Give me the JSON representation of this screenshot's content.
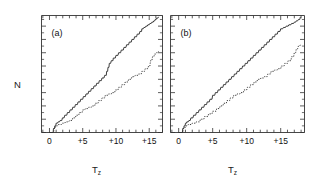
{
  "figure": {
    "background": "#ffffff",
    "line_color": "#333333",
    "text_color": "#111111"
  },
  "axis": {
    "y_label": "N",
    "x_label_main": "T",
    "x_label_sub": "z",
    "y_ticks": [
      0,
      10,
      20,
      30,
      40,
      50,
      60,
      70,
      80
    ],
    "y_tick_labels": [
      "0",
      "10",
      "20",
      "30",
      "40",
      "50",
      "60",
      "70",
      "80"
    ],
    "y_min": 0,
    "y_max": 88,
    "x_ticks": [
      0,
      5,
      10,
      15
    ],
    "x_tick_labels": [
      "0",
      "+5",
      "+10",
      "+15"
    ],
    "x_minor_step": 1,
    "x_min": -1.2,
    "x_max": 18.5
  },
  "panels": [
    {
      "tag": "(a)",
      "x_min": -1.2,
      "x_max": 17.0
    },
    {
      "tag": "(b)",
      "x_min": -1.2,
      "x_max": 18.5
    }
  ],
  "chart_data": {
    "type": "line",
    "title": "",
    "subtitle": "",
    "xlabel": "Tz",
    "ylabel": "N",
    "xlim": [
      -1.2,
      18.5
    ],
    "ylim": [
      0,
      88
    ],
    "grid": false,
    "legend": "none",
    "annotations": [
      "(a)",
      "(b)"
    ],
    "panels": [
      {
        "tag": "(a)",
        "series": [
          {
            "name": "solid-staircase-a",
            "style": "solid",
            "x": [
              0.0,
              0.55,
              0.6,
              0.75,
              0.8,
              0.95,
              1.0,
              1.2,
              1.3,
              1.5,
              1.6,
              1.85,
              1.95,
              2.2,
              2.3,
              2.6,
              2.7,
              3.0,
              3.1,
              3.4,
              3.5,
              3.8,
              3.9,
              4.2,
              4.3,
              4.6,
              4.7,
              5.0,
              5.1,
              5.4,
              5.5,
              5.8,
              5.9,
              6.2,
              6.3,
              6.6,
              6.7,
              7.0,
              7.1,
              7.4,
              7.5,
              7.8,
              7.9,
              8.2,
              8.3,
              8.55,
              8.6,
              8.75,
              8.8,
              8.95,
              9.0,
              9.2,
              9.3,
              9.55,
              9.6,
              9.9,
              10.0,
              10.3,
              10.4,
              10.7,
              10.8,
              11.1,
              11.2,
              11.5,
              11.6,
              11.9,
              12.0,
              12.3,
              12.4,
              12.7,
              12.8,
              13.1,
              13.2,
              13.5,
              13.6,
              13.85,
              13.9,
              14.1,
              14.2,
              14.4,
              14.5,
              14.7,
              14.8,
              15.0,
              15.1,
              15.3,
              15.4,
              15.6,
              15.7,
              15.85,
              15.9,
              16.05,
              16.1,
              16.3,
              16.4
            ],
            "y": [
              0,
              0,
              3,
              3,
              5,
              5,
              7,
              7,
              8,
              8,
              9,
              9,
              11,
              11,
              13,
              13,
              15,
              15,
              17,
              17,
              19,
              19,
              21,
              21,
              23,
              23,
              25,
              25,
              27,
              27,
              29,
              29,
              31,
              31,
              33,
              33,
              35,
              35,
              37,
              37,
              39,
              39,
              41,
              41,
              43,
              43,
              46,
              46,
              49,
              49,
              52,
              52,
              54,
              54,
              56,
              56,
              58,
              58,
              60,
              60,
              62,
              62,
              64,
              64,
              66,
              66,
              68,
              68,
              70,
              70,
              72,
              72,
              74,
              74,
              76,
              76,
              78,
              78,
              79,
              79,
              80,
              80,
              81,
              81,
              82,
              82,
              83,
              83,
              84,
              84,
              85,
              85,
              86,
              86,
              87
            ],
            "description": "Upper solid cumulative step function rising from 0 to ~87"
          },
          {
            "name": "dotted-staircase-a",
            "style": "dotted",
            "x": [
              0.0,
              0.6,
              0.7,
              0.85,
              0.95,
              1.2,
              1.3,
              1.8,
              1.9,
              2.3,
              2.4,
              2.9,
              3.0,
              3.4,
              3.5,
              3.9,
              4.0,
              4.4,
              4.5,
              4.9,
              5.0,
              5.3,
              5.4,
              5.8,
              5.9,
              6.3,
              6.4,
              6.8,
              6.9,
              7.3,
              7.4,
              7.8,
              7.9,
              8.3,
              8.4,
              8.8,
              8.9,
              9.3,
              9.4,
              9.8,
              9.9,
              10.3,
              10.4,
              10.8,
              10.9,
              11.3,
              11.4,
              11.8,
              11.9,
              12.3,
              12.4,
              12.8,
              12.9,
              13.3,
              13.4,
              13.8,
              13.9,
              14.3,
              14.4,
              14.8,
              14.9,
              15.1,
              15.2,
              15.4,
              15.5,
              15.7,
              15.8,
              16.0,
              16.1,
              16.3,
              16.4
            ],
            "y": [
              0,
              0,
              3,
              3,
              5,
              5,
              6,
              6,
              7,
              7,
              8,
              8,
              9,
              9,
              11,
              11,
              13,
              13,
              15,
              15,
              17,
              17,
              18,
              18,
              19,
              19,
              20,
              20,
              22,
              22,
              24,
              24,
              26,
              26,
              28,
              28,
              29,
              29,
              30,
              30,
              32,
              32,
              34,
              34,
              36,
              36,
              38,
              38,
              40,
              40,
              42,
              42,
              43,
              43,
              44,
              44,
              46,
              46,
              48,
              48,
              50,
              50,
              54,
              54,
              57,
              57,
              59,
              59,
              60,
              60,
              61
            ],
            "description": "Lower dotted cumulative step function rising from 0 to ~61"
          }
        ]
      },
      {
        "tag": "(b)",
        "series": [
          {
            "name": "solid-staircase-b",
            "style": "solid",
            "x": [
              0.0,
              0.55,
              0.6,
              0.75,
              0.8,
              0.95,
              1.0,
              1.15,
              1.2,
              1.4,
              1.5,
              1.7,
              1.8,
              2.1,
              2.2,
              2.5,
              2.6,
              2.9,
              3.0,
              3.3,
              3.4,
              3.7,
              3.8,
              4.1,
              4.2,
              4.5,
              4.6,
              4.9,
              5.0,
              5.3,
              5.4,
              5.7,
              5.8,
              6.1,
              6.2,
              6.5,
              6.6,
              6.9,
              7.0,
              7.3,
              7.4,
              7.7,
              7.8,
              8.1,
              8.2,
              8.5,
              8.6,
              8.9,
              9.0,
              9.3,
              9.4,
              9.7,
              9.8,
              10.1,
              10.2,
              10.5,
              10.6,
              10.9,
              11.0,
              11.3,
              11.4,
              11.7,
              11.8,
              12.1,
              12.2,
              12.5,
              12.6,
              12.9,
              13.0,
              13.3,
              13.4,
              13.7,
              13.8,
              14.1,
              14.2,
              14.5,
              14.6,
              14.9,
              15.0,
              15.3,
              15.4,
              15.7,
              15.8,
              16.1,
              16.2,
              16.5,
              16.6,
              16.9,
              17.0,
              17.2,
              17.3,
              17.5,
              17.6,
              17.8,
              17.9
            ],
            "y": [
              0,
              0,
              3,
              3,
              5,
              5,
              7,
              7,
              8,
              8,
              9,
              9,
              11,
              11,
              13,
              13,
              15,
              15,
              17,
              17,
              19,
              19,
              21,
              21,
              23,
              23,
              25,
              25,
              28,
              28,
              30,
              30,
              32,
              32,
              34,
              34,
              36,
              36,
              38,
              38,
              40,
              40,
              42,
              42,
              44,
              44,
              46,
              46,
              48,
              48,
              50,
              50,
              52,
              52,
              54,
              54,
              56,
              56,
              58,
              58,
              60,
              60,
              62,
              62,
              64,
              64,
              66,
              66,
              68,
              68,
              70,
              70,
              72,
              72,
              74,
              74,
              76,
              76,
              78,
              78,
              79,
              79,
              80,
              80,
              81,
              81,
              82,
              82,
              83,
              83,
              84,
              84,
              85,
              85,
              87
            ],
            "description": "Upper solid cumulative step function for panel b"
          },
          {
            "name": "dotted-staircase-b",
            "style": "dotted",
            "x": [
              0.0,
              0.6,
              0.7,
              0.9,
              1.0,
              1.3,
              1.4,
              1.9,
              2.0,
              2.5,
              2.6,
              3.1,
              3.2,
              3.7,
              3.8,
              4.3,
              4.4,
              4.9,
              5.0,
              5.5,
              5.6,
              6.0,
              6.1,
              6.5,
              6.6,
              7.0,
              7.1,
              7.5,
              7.6,
              8.0,
              8.1,
              8.5,
              8.6,
              9.0,
              9.1,
              9.5,
              9.6,
              10.0,
              10.1,
              10.5,
              10.6,
              11.0,
              11.1,
              11.5,
              11.6,
              12.0,
              12.1,
              12.5,
              12.6,
              13.0,
              13.1,
              13.5,
              13.6,
              14.0,
              14.1,
              14.5,
              14.6,
              15.0,
              15.1,
              15.5,
              15.6,
              16.0,
              16.1,
              16.5,
              16.6,
              16.9,
              17.0,
              17.2,
              17.3,
              17.5,
              17.6,
              17.8,
              17.9
            ],
            "y": [
              0,
              0,
              3,
              3,
              5,
              5,
              6,
              6,
              7,
              7,
              8,
              8,
              10,
              10,
              12,
              12,
              14,
              14,
              16,
              16,
              18,
              18,
              20,
              20,
              22,
              22,
              24,
              24,
              26,
              26,
              28,
              28,
              29,
              29,
              30,
              30,
              32,
              32,
              34,
              34,
              36,
              36,
              38,
              38,
              40,
              40,
              41,
              41,
              42,
              42,
              44,
              44,
              46,
              46,
              47,
              47,
              48,
              48,
              50,
              50,
              52,
              52,
              54,
              54,
              57,
              57,
              60,
              60,
              63,
              63,
              65,
              65,
              66
            ],
            "description": "Lower dotted cumulative step function for panel b"
          }
        ]
      }
    ]
  }
}
